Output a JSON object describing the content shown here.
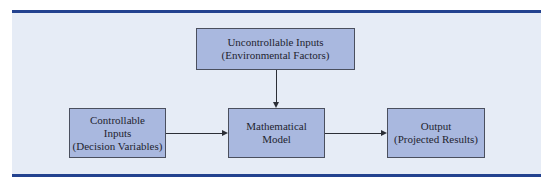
{
  "diagram": {
    "type": "flowchart",
    "colors": {
      "background": "#e6ecf6",
      "box_fill": "#a9b8df",
      "box_border": "#4a4f5e",
      "rule": "#23428f",
      "arrow": "#2b2e36"
    },
    "nodes": {
      "uncontrollable": {
        "line1": "Uncontrollable Inputs",
        "line2": "(Environmental Factors)"
      },
      "controllable": {
        "line1": "Controllable",
        "line2": "Inputs",
        "line3": "(Decision Variables)"
      },
      "model": {
        "line1": "Mathematical",
        "line2": "Model"
      },
      "output": {
        "line1": "Output",
        "line2": "(Projected Results)"
      }
    },
    "edges": [
      {
        "from": "uncontrollable",
        "to": "model"
      },
      {
        "from": "controllable",
        "to": "model"
      },
      {
        "from": "model",
        "to": "output"
      }
    ]
  }
}
